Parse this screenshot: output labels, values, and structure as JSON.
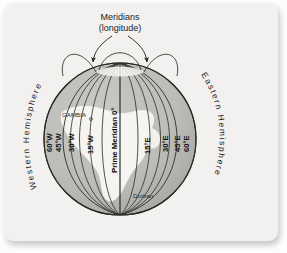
{
  "figure": {
    "title_line1": "Meridians",
    "title_line2": "(longitude)",
    "hemispheres": {
      "west": "Western Hemisphere",
      "east": "Eastern Hemisphere"
    },
    "prime_meridian_label": "Prime Meridian 0°",
    "meridian_labels": [
      {
        "text": "60°W",
        "lon": -60
      },
      {
        "text": "45°W",
        "lon": -45
      },
      {
        "text": "30°W",
        "lon": -30
      },
      {
        "text": "15°W",
        "lon": -15
      },
      {
        "text": "15°E",
        "lon": 15
      },
      {
        "text": "30°E",
        "lon": 30
      },
      {
        "text": "45°E",
        "lon": 45
      },
      {
        "text": "60°E",
        "lon": 60
      }
    ],
    "places": [
      {
        "name": "GAMBIA"
      },
      {
        "name": "Durban"
      }
    ],
    "colors": {
      "page_background": "#fdfdfd",
      "card_background": "#f2f1ef",
      "globe_ocean": "#b8b8b4",
      "globe_land": "#f6f5f2",
      "meridian_line": "#35352f",
      "outline": "#2a2a26",
      "text": "#121212"
    }
  }
}
